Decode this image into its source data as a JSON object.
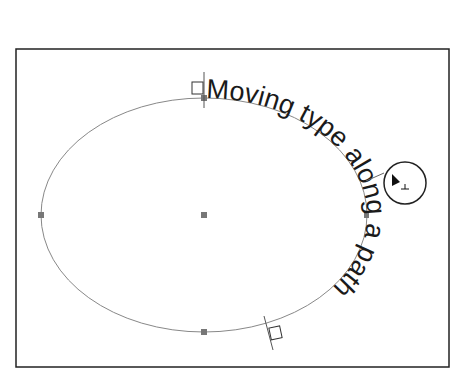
{
  "artboard": {
    "border_color": "#222222",
    "background": "#ffffff"
  },
  "path": {
    "shape": "ellipse",
    "stroke_color": "#888888",
    "anchor_color": "#777777"
  },
  "type_on_path": {
    "text": "Moving type along a path",
    "color": "#1a1a1a",
    "font_size_px": 27
  },
  "handles": {
    "start_bracket": "start-handle",
    "end_bracket": "end-handle"
  },
  "cursor": {
    "icon": "type-on-path-cursor-icon",
    "glyph": "⊥"
  }
}
